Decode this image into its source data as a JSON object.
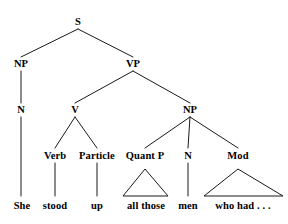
{
  "figure": {
    "type": "syntax-tree",
    "sentence": "She stood up all those men who had . . .",
    "stroke_color": "#1a1a1a",
    "background_color": "#ffffff",
    "text_color": "#000000",
    "width": 288,
    "height": 224
  },
  "nodes": {
    "s": {
      "label": "S",
      "x": 78,
      "y": 22
    },
    "np_subject": {
      "label": "NP",
      "x": 21,
      "y": 64
    },
    "vp": {
      "label": "VP",
      "x": 133,
      "y": 64
    },
    "n_subject": {
      "label": "N",
      "x": 21,
      "y": 110
    },
    "v": {
      "label": "V",
      "x": 75,
      "y": 110
    },
    "np_object": {
      "label": "NP",
      "x": 190,
      "y": 110
    },
    "verb": {
      "label": "Verb",
      "x": 55,
      "y": 156
    },
    "particle": {
      "label": "Particle",
      "x": 97,
      "y": 156
    },
    "quant_p": {
      "label": "Quant P",
      "x": 145,
      "y": 156
    },
    "n_object": {
      "label": "N",
      "x": 188,
      "y": 156
    },
    "mod": {
      "label": "Mod",
      "x": 238,
      "y": 156
    }
  },
  "leaves": {
    "she": {
      "label": "She",
      "x": 22,
      "y": 206
    },
    "stood": {
      "label": "stood",
      "x": 55,
      "y": 206
    },
    "up": {
      "label": "up",
      "x": 97,
      "y": 206
    },
    "all_those": {
      "label": "all those",
      "x": 146,
      "y": 206
    },
    "men": {
      "label": "men",
      "x": 188,
      "y": 206
    },
    "who_had": {
      "label": "who had . . .",
      "x": 243,
      "y": 206
    }
  },
  "triangles": [
    {
      "name": "quant-p-triangle",
      "apex_x": 145,
      "apex_y": 169,
      "left_x": 123,
      "right_x": 168,
      "base_y": 196
    },
    {
      "name": "mod-triangle",
      "apex_x": 238,
      "apex_y": 169,
      "left_x": 204,
      "right_x": 283,
      "base_y": 196
    }
  ],
  "edges": [
    {
      "name": "s-to-np-subject",
      "x1": 78,
      "y1": 29,
      "x2": 21,
      "y2": 57
    },
    {
      "name": "s-to-vp",
      "x1": 78,
      "y1": 29,
      "x2": 133,
      "y2": 57
    },
    {
      "name": "np-subject-to-n",
      "x1": 21,
      "y1": 71,
      "x2": 21,
      "y2": 103
    },
    {
      "name": "vp-to-v",
      "x1": 133,
      "y1": 71,
      "x2": 75,
      "y2": 103
    },
    {
      "name": "vp-to-np-object",
      "x1": 133,
      "y1": 71,
      "x2": 190,
      "y2": 103
    },
    {
      "name": "n-subject-to-she",
      "x1": 21,
      "y1": 117,
      "x2": 21,
      "y2": 196
    },
    {
      "name": "v-to-verb",
      "x1": 75,
      "y1": 117,
      "x2": 55,
      "y2": 148
    },
    {
      "name": "v-to-particle",
      "x1": 75,
      "y1": 117,
      "x2": 97,
      "y2": 148
    },
    {
      "name": "np-object-to-quant-p",
      "x1": 190,
      "y1": 117,
      "x2": 145,
      "y2": 148
    },
    {
      "name": "np-object-to-n",
      "x1": 190,
      "y1": 117,
      "x2": 188,
      "y2": 148
    },
    {
      "name": "np-object-to-mod",
      "x1": 190,
      "y1": 117,
      "x2": 238,
      "y2": 148
    },
    {
      "name": "verb-to-stood",
      "x1": 55,
      "y1": 163,
      "x2": 55,
      "y2": 196
    },
    {
      "name": "particle-to-up",
      "x1": 97,
      "y1": 163,
      "x2": 97,
      "y2": 196
    },
    {
      "name": "n-object-to-men",
      "x1": 188,
      "y1": 163,
      "x2": 188,
      "y2": 196
    }
  ]
}
